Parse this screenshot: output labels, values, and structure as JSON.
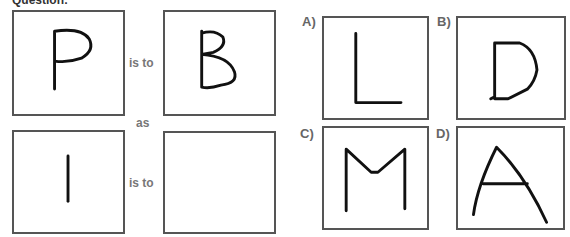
{
  "header": {
    "partial_text": "Question:"
  },
  "analogy": {
    "row1": {
      "left_letter": "P",
      "connector": "is to",
      "right_letter": "B"
    },
    "between": "as",
    "row2": {
      "left_letter": "I",
      "connector": "is to",
      "right_letter": ""
    }
  },
  "options": [
    {
      "label": "A)",
      "letter": "L"
    },
    {
      "label": "B)",
      "letter": "D"
    },
    {
      "label": "C)",
      "letter": "M"
    },
    {
      "label": "D)",
      "letter": "A"
    }
  ]
}
